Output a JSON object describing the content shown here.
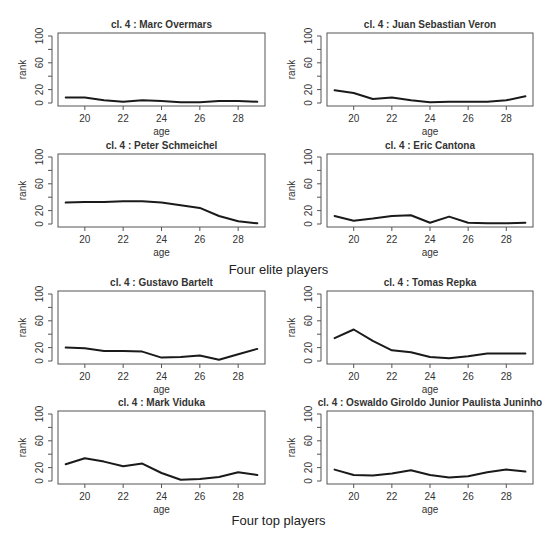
{
  "figure": {
    "captions": [
      {
        "text": "Four elite players",
        "y": 262
      },
      {
        "text": "Four top players",
        "y": 513
      }
    ]
  },
  "chart_data": [
    {
      "type": "line",
      "title": "cl. 4 :  Marc Overmars",
      "group": "Four elite players",
      "xlabel": "age",
      "ylabel": "rank",
      "x": [
        19,
        20,
        21,
        22,
        23,
        24,
        25,
        26,
        27,
        28,
        29
      ],
      "values": [
        8,
        8,
        4,
        2,
        4,
        3,
        1,
        1,
        3,
        3,
        2
      ],
      "xticks": [
        20,
        22,
        24,
        26,
        28
      ],
      "yticks": [
        0,
        20,
        60,
        100
      ],
      "ylim": [
        0,
        100
      ],
      "xlim": [
        18.6,
        29.4
      ]
    },
    {
      "type": "line",
      "title": "cl. 4 :  Juan Sebastian Veron",
      "group": "Four elite players",
      "xlabel": "age",
      "ylabel": "rank",
      "x": [
        19,
        20,
        21,
        22,
        23,
        24,
        25,
        26,
        27,
        28,
        29
      ],
      "values": [
        19,
        15,
        6,
        8,
        4,
        1,
        2,
        2,
        2,
        4,
        10
      ],
      "xticks": [
        20,
        22,
        24,
        26,
        28
      ],
      "yticks": [
        0,
        20,
        60,
        100
      ],
      "ylim": [
        0,
        100
      ],
      "xlim": [
        18.6,
        29.4
      ]
    },
    {
      "type": "line",
      "title": "cl. 4 :  Peter Schmeichel",
      "group": "Four elite players",
      "xlabel": "age",
      "ylabel": "rank",
      "x": [
        19,
        20,
        21,
        22,
        23,
        24,
        25,
        26,
        27,
        28,
        29
      ],
      "values": [
        32,
        33,
        33,
        34,
        34,
        32,
        28,
        24,
        12,
        4,
        1
      ],
      "xticks": [
        20,
        22,
        24,
        26,
        28
      ],
      "yticks": [
        0,
        20,
        60,
        100
      ],
      "ylim": [
        0,
        100
      ],
      "xlim": [
        18.6,
        29.4
      ]
    },
    {
      "type": "line",
      "title": "cl. 4 :  Eric Cantona",
      "group": "Four elite players",
      "xlabel": "age",
      "ylabel": "rank",
      "x": [
        19,
        20,
        21,
        22,
        23,
        24,
        25,
        26,
        27,
        28,
        29
      ],
      "values": [
        12,
        5,
        8,
        12,
        13,
        2,
        11,
        2,
        1,
        1,
        2
      ],
      "xticks": [
        20,
        22,
        24,
        26,
        28
      ],
      "yticks": [
        0,
        20,
        60,
        100
      ],
      "ylim": [
        0,
        100
      ],
      "xlim": [
        18.6,
        29.4
      ]
    },
    {
      "type": "line",
      "title": "cl. 4 :  Gustavo Bartelt",
      "group": "Four top players",
      "xlabel": "age",
      "ylabel": "rank",
      "x": [
        19,
        20,
        21,
        22,
        23,
        24,
        25,
        26,
        27,
        28,
        29
      ],
      "values": [
        20,
        19,
        15,
        15,
        14,
        5,
        6,
        8,
        2,
        10,
        18
      ],
      "xticks": [
        20,
        22,
        24,
        26,
        28
      ],
      "yticks": [
        0,
        20,
        60,
        100
      ],
      "ylim": [
        0,
        100
      ],
      "xlim": [
        18.6,
        29.4
      ]
    },
    {
      "type": "line",
      "title": "cl. 4 :  Tomas Repka",
      "group": "Four top players",
      "xlabel": "age",
      "ylabel": "rank",
      "x": [
        19,
        20,
        21,
        22,
        23,
        24,
        25,
        26,
        27,
        28,
        29
      ],
      "values": [
        34,
        47,
        30,
        16,
        13,
        6,
        4,
        7,
        11,
        11,
        11
      ],
      "xticks": [
        20,
        22,
        24,
        26,
        28
      ],
      "yticks": [
        0,
        20,
        60,
        100
      ],
      "ylim": [
        0,
        100
      ],
      "xlim": [
        18.6,
        29.4
      ]
    },
    {
      "type": "line",
      "title": "cl. 4 :  Mark Viduka",
      "group": "Four top players",
      "xlabel": "age",
      "ylabel": "rank",
      "x": [
        19,
        20,
        21,
        22,
        23,
        24,
        25,
        26,
        27,
        28,
        29
      ],
      "values": [
        25,
        34,
        29,
        22,
        26,
        12,
        2,
        3,
        6,
        13,
        9
      ],
      "xticks": [
        20,
        22,
        24,
        26,
        28
      ],
      "yticks": [
        0,
        20,
        60,
        100
      ],
      "ylim": [
        0,
        100
      ],
      "xlim": [
        18.6,
        29.4
      ]
    },
    {
      "type": "line",
      "title": "cl. 4 :  Oswaldo Giroldo Junior Paulista Juninho",
      "group": "Four top players",
      "xlabel": "age",
      "ylabel": "rank",
      "x": [
        19,
        20,
        21,
        22,
        23,
        24,
        25,
        26,
        27,
        28,
        29
      ],
      "values": [
        17,
        9,
        8,
        11,
        16,
        9,
        5,
        7,
        13,
        17,
        14
      ],
      "xticks": [
        20,
        22,
        24,
        26,
        28
      ],
      "yticks": [
        0,
        20,
        60,
        100
      ],
      "ylim": [
        0,
        100
      ],
      "xlim": [
        18.6,
        29.4
      ]
    }
  ],
  "layout": {
    "panels": [
      {
        "left": 58,
        "top": 33,
        "width": 207,
        "height": 73
      },
      {
        "left": 327,
        "top": 33,
        "width": 206,
        "height": 73
      },
      {
        "left": 58,
        "top": 154,
        "width": 207,
        "height": 73
      },
      {
        "left": 327,
        "top": 154,
        "width": 206,
        "height": 73
      },
      {
        "left": 58,
        "top": 291,
        "width": 207,
        "height": 73
      },
      {
        "left": 327,
        "top": 291,
        "width": 206,
        "height": 73
      },
      {
        "left": 58,
        "top": 411,
        "width": 207,
        "height": 73
      },
      {
        "left": 327,
        "top": 411,
        "width": 206,
        "height": 73
      }
    ],
    "colors": {
      "line": "#1a1a1a",
      "axis": "#555555",
      "text": "#333333",
      "box": "#555555"
    }
  }
}
